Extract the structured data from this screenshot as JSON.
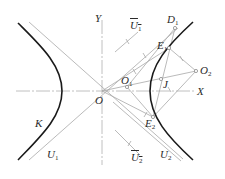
{
  "diagram": {
    "type": "hyperbola construction",
    "axes": {
      "x_label": "X",
      "y_label": "Y",
      "origin_label": "O"
    },
    "curve_label": "K",
    "colors": {
      "curve": "#1a1a1a",
      "construction": "#a8a8a8",
      "axis": "#b0b0b0",
      "point_fill": "#ffffff"
    },
    "labels": {
      "Y": "Y",
      "X": "X",
      "O": "O",
      "K": "K",
      "U1": {
        "main": "U",
        "sub": "1"
      },
      "U1bar": {
        "main": "U",
        "sub": "1"
      },
      "U2": {
        "main": "U",
        "sub": "2"
      },
      "U2bar": {
        "main": "U",
        "sub": "2"
      },
      "D1": {
        "main": "D",
        "sub": "1"
      },
      "E1": {
        "main": "E",
        "sub": "1"
      },
      "E2": {
        "main": "E",
        "sub": "2"
      },
      "O1": {
        "main": "O",
        "sub": "1"
      },
      "O2": {
        "main": "O",
        "sub": "2"
      },
      "J": "J"
    }
  }
}
